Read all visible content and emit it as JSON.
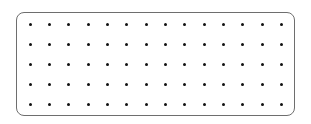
{
  "diagram": {
    "type": "dot-grid",
    "frame": {
      "border_color": "#6e6e6e",
      "background": "#ffffff",
      "corner_radius_px": 8
    },
    "dot_color": "#111111",
    "rows": 5,
    "columns": 14,
    "column_x": [
      30,
      49.3,
      68.7,
      88,
      107.3,
      126.7,
      146,
      165.3,
      184.7,
      204,
      223.3,
      242.7,
      262,
      281.3
    ],
    "row_y": [
      24,
      44,
      64,
      84,
      104
    ]
  }
}
